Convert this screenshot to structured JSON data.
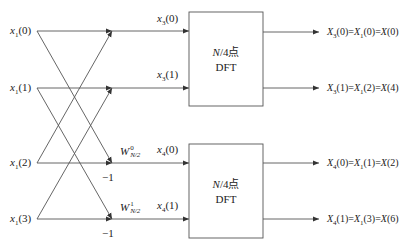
{
  "diagram": {
    "type": "butterfly-flow-graph",
    "inputs": [
      {
        "id": "x1_0",
        "base": "x",
        "sub": "1",
        "arg": "(0)"
      },
      {
        "id": "x1_1",
        "base": "x",
        "sub": "1",
        "arg": "(1)"
      },
      {
        "id": "x1_2",
        "base": "x",
        "sub": "1",
        "arg": "(2)"
      },
      {
        "id": "x1_3",
        "base": "x",
        "sub": "1",
        "arg": "(3)"
      }
    ],
    "intermediates": [
      {
        "id": "x3_0",
        "base": "x",
        "sub": "3",
        "arg": "(0)"
      },
      {
        "id": "x3_1",
        "base": "x",
        "sub": "3",
        "arg": "(1)"
      },
      {
        "id": "x4_0",
        "base": "x",
        "sub": "4",
        "arg": "(0)"
      },
      {
        "id": "x4_1",
        "base": "x",
        "sub": "4",
        "arg": "(1)"
      }
    ],
    "twiddles": [
      {
        "base": "W",
        "sub": "N/2",
        "sup": "0"
      },
      {
        "base": "W",
        "sub": "N/2",
        "sup": "1"
      }
    ],
    "multipliers": [
      "−1",
      "−1"
    ],
    "blocks": [
      {
        "line1": "N/4点",
        "line2": "DFT"
      },
      {
        "line1": "N/4点",
        "line2": "DFT"
      }
    ],
    "outputs": [
      "X3(0)=X1(0)=X(0)",
      "X3(1)=X1(2)=X(4)",
      "X4(0)=X1(1)=X(2)",
      "X4(1)=X1(3)=X(6)"
    ],
    "output_parts": [
      {
        "a": "X",
        "as": "3",
        "aa": "(0)=",
        "b": "X",
        "bs": "1",
        "ba": "(0)=",
        "c": "X",
        "ca": "(0)"
      },
      {
        "a": "X",
        "as": "3",
        "aa": "(1)=",
        "b": "X",
        "bs": "1",
        "ba": "(2)=",
        "c": "X",
        "ca": "(4)"
      },
      {
        "a": "X",
        "as": "4",
        "aa": "(0)=",
        "b": "X",
        "bs": "1",
        "ba": "(1)=",
        "c": "X",
        "ca": "(2)"
      },
      {
        "a": "X",
        "as": "4",
        "aa": "(1)=",
        "b": "X",
        "bs": "1",
        "ba": "(3)=",
        "c": "X",
        "ca": "(6)"
      }
    ],
    "line_color": "#444444"
  }
}
